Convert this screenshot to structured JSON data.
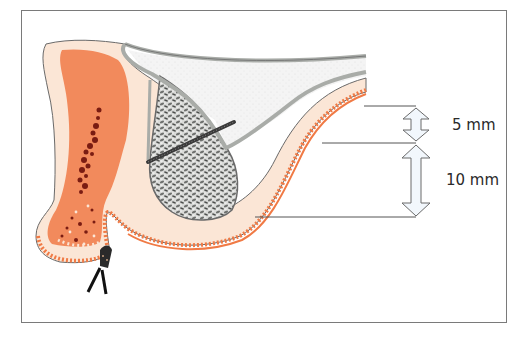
{
  "diagram": {
    "measurements": [
      {
        "label": "5 mm",
        "arrow": "double-arrow-small"
      },
      {
        "label": "10 mm",
        "arrow": "double-arrow-large"
      }
    ],
    "regions": [
      {
        "name": "bone-cortex",
        "color": "#fbe6d6"
      },
      {
        "name": "bone-marrow",
        "color": "#f28a5c"
      },
      {
        "name": "marrow-vessels",
        "color": "#7a1c12"
      },
      {
        "name": "sinus-membrane",
        "color": "#a9aca8"
      },
      {
        "name": "sinus-cavity",
        "color": "#f3f3f3"
      },
      {
        "name": "bone-graft",
        "color": "#8c8e8c"
      },
      {
        "name": "gingiva-epithelium",
        "color": "#f07a45"
      },
      {
        "name": "implant-screw",
        "color": "#3a3a3a"
      }
    ],
    "colors": {
      "frame": "#7a7a7a",
      "reference_lines": "#555555",
      "arrow_fill": "#f2f7fc",
      "arrow_stroke": "#6a6a6a",
      "text": "#2a2a2a"
    }
  }
}
